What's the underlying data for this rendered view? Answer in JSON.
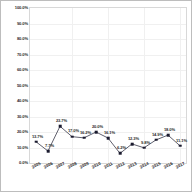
{
  "chart_data": {
    "type": "line",
    "title": "",
    "xlabel": "",
    "ylabel": "",
    "ylim": [
      0,
      100
    ],
    "grid": true,
    "legend": "none",
    "categories": [
      "2005",
      "2006",
      "2007",
      "2008",
      "2009",
      "2010",
      "2011",
      "2012",
      "2013",
      "2014",
      "2015",
      "2016",
      "2017"
    ],
    "values": [
      13.7,
      7.7,
      23.7,
      17.0,
      16.2,
      20.0,
      16.1,
      6.2,
      12.3,
      9.8,
      14.9,
      18.0,
      11.1
    ],
    "data_labels": [
      "13.7%",
      "7.7%",
      "23.7%",
      "17.0%",
      "16.2%",
      "20.0%",
      "16.1%",
      "6.2%",
      "12.3%",
      "9.8%",
      "14.9%",
      "18.0%",
      "11.1%"
    ],
    "ytick_values": [
      0,
      10,
      20,
      30,
      40,
      50,
      60,
      70,
      80,
      90,
      100
    ],
    "ytick_labels": [
      "0.0%",
      "10.0%",
      "20.0%",
      "30.0%",
      "40.0%",
      "50.0%",
      "60.0%",
      "70.0%",
      "80.0%",
      "90.0%",
      "100.0%"
    ],
    "series_color": "#1a1a2e",
    "marker_color": "#1a1a2e",
    "grid_color": "#f0f0f0",
    "axis_color": "#d8d8d8"
  }
}
